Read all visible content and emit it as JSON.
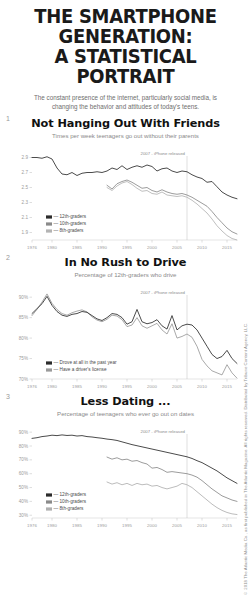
{
  "header": {
    "title_line1": "THE SMARTPHONE GENERATION:",
    "title_line2": "A STATISTICAL PORTRAIT",
    "subtitle": "The constant presence of the internet, particularly social media, is changing the behavior and attitudes of today's teens."
  },
  "copyright": "© 2018 The Atlantic Media Co., as first published in The Atlantic Magazine. All rights reserved. Distributed by Tribune Content Agency, LLC.",
  "sections": [
    {
      "number": "1"
    },
    {
      "number": "2"
    },
    {
      "number": "3"
    }
  ],
  "chart_data": [
    {
      "type": "line",
      "index": 0,
      "number": "1",
      "title": "Not Hanging Out With Friends",
      "subtitle": "Times per week teenagers go out without their parents",
      "xlabel": "",
      "ylabel": "",
      "xlim": [
        1976,
        2017
      ],
      "ylim": [
        1.8,
        3.0
      ],
      "yticks": [
        2.9,
        2.7,
        2.5,
        2.3,
        2.1,
        1.9
      ],
      "ytick_labels": [
        "2.9",
        "2.7",
        "2.5",
        "2.3",
        "2.1",
        "1.9"
      ],
      "xticks": [
        1976,
        1980,
        1985,
        1990,
        1995,
        2000,
        2005,
        2010,
        2015
      ],
      "xtick_labels": [
        "1976",
        "1980",
        "1985",
        "1990",
        "1995",
        "2000",
        "2005",
        "2010",
        "2015"
      ],
      "grid": false,
      "legend_position": "bottom-left",
      "annotation": {
        "text": "2007 - iPhone released",
        "x": 2007
      },
      "series": [
        {
          "name": "12th-graders",
          "color": "#2b2b2b",
          "x": [
            1976,
            1977,
            1978,
            1979,
            1980,
            1981,
            1982,
            1983,
            1984,
            1985,
            1986,
            1987,
            1988,
            1989,
            1990,
            1991,
            1992,
            1993,
            1994,
            1995,
            1996,
            1997,
            1998,
            1999,
            2000,
            2001,
            2002,
            2003,
            2004,
            2005,
            2006,
            2007,
            2008,
            2009,
            2010,
            2011,
            2012,
            2013,
            2014,
            2015,
            2016,
            2017
          ],
          "values": [
            2.9,
            2.9,
            2.89,
            2.91,
            2.88,
            2.76,
            2.68,
            2.67,
            2.7,
            2.66,
            2.69,
            2.7,
            2.7,
            2.71,
            2.7,
            2.72,
            2.76,
            2.74,
            2.79,
            2.74,
            2.77,
            2.79,
            2.77,
            2.8,
            2.78,
            2.72,
            2.75,
            2.76,
            2.72,
            2.7,
            2.72,
            2.71,
            2.67,
            2.64,
            2.62,
            2.57,
            2.58,
            2.51,
            2.44,
            2.4,
            2.37,
            2.35
          ]
        },
        {
          "name": "10th-graders",
          "color": "#8a8a8a",
          "x": [
            1991,
            1992,
            1993,
            1994,
            1995,
            1996,
            1997,
            1998,
            1999,
            2000,
            2001,
            2002,
            2003,
            2004,
            2005,
            2006,
            2007,
            2008,
            2009,
            2010,
            2011,
            2012,
            2013,
            2014,
            2015,
            2016,
            2017
          ],
          "values": [
            2.53,
            2.48,
            2.55,
            2.58,
            2.6,
            2.57,
            2.53,
            2.49,
            2.5,
            2.46,
            2.44,
            2.47,
            2.44,
            2.42,
            2.41,
            2.42,
            2.4,
            2.37,
            2.33,
            2.29,
            2.25,
            2.18,
            2.1,
            2.03,
            1.96,
            1.91,
            1.88
          ]
        },
        {
          "name": "8th-graders",
          "color": "#b4b4b4",
          "x": [
            1991,
            1992,
            1993,
            1994,
            1995,
            1996,
            1997,
            1998,
            1999,
            2000,
            2001,
            2002,
            2003,
            2004,
            2005,
            2006,
            2007,
            2008,
            2009,
            2010,
            2011,
            2012,
            2013,
            2014,
            2015,
            2016,
            2017
          ],
          "values": [
            2.5,
            2.46,
            2.52,
            2.56,
            2.58,
            2.54,
            2.49,
            2.45,
            2.46,
            2.42,
            2.41,
            2.44,
            2.4,
            2.39,
            2.38,
            2.39,
            2.37,
            2.33,
            2.28,
            2.22,
            2.16,
            2.08,
            1.99,
            1.92,
            1.86,
            1.82,
            1.8
          ]
        }
      ]
    },
    {
      "type": "line",
      "index": 1,
      "number": "2",
      "title": "In No Rush to Drive",
      "subtitle": "Percentage of 12th-graders who drive",
      "xlabel": "",
      "ylabel": "",
      "xlim": [
        1976,
        2017
      ],
      "ylim": [
        70,
        92
      ],
      "yticks": [
        90,
        85,
        80,
        75,
        70
      ],
      "ytick_labels": [
        "90%",
        "85%",
        "80%",
        "75%",
        "70%"
      ],
      "xticks": [
        1976,
        1980,
        1985,
        1990,
        1995,
        2000,
        2005,
        2010,
        2015
      ],
      "xtick_labels": [
        "1976",
        "1980",
        "1985",
        "1990",
        "1995",
        "2000",
        "2005",
        "2010",
        "2015"
      ],
      "grid": false,
      "legend_position": "bottom-left",
      "annotation": {
        "text": "2007 - iPhone released",
        "x": 2007
      },
      "series": [
        {
          "name": "Drove at all in the past year",
          "color": "#2b2b2b",
          "x": [
            1976,
            1977,
            1978,
            1979,
            1980,
            1981,
            1982,
            1983,
            1984,
            1985,
            1986,
            1987,
            1988,
            1989,
            1990,
            1991,
            1992,
            1993,
            1994,
            1995,
            1996,
            1997,
            1998,
            1999,
            2000,
            2001,
            2002,
            2003,
            2004,
            2005,
            2006,
            2007,
            2008,
            2009,
            2010,
            2011,
            2012,
            2013,
            2014,
            2015,
            2016,
            2017
          ],
          "values": [
            86.0,
            87.2,
            88.4,
            90.2,
            88.0,
            86.5,
            85.6,
            85.3,
            85.8,
            86.0,
            86.5,
            86.3,
            85.5,
            84.7,
            84.3,
            85.0,
            86.0,
            85.8,
            85.0,
            83.4,
            84.0,
            87.0,
            84.0,
            83.5,
            83.8,
            84.5,
            83.0,
            82.2,
            85.5,
            82.0,
            83.0,
            83.4,
            83.2,
            82.0,
            80.0,
            78.0,
            76.0,
            75.0,
            75.5,
            77.0,
            75.0,
            73.8
          ]
        },
        {
          "name": "Have a driver's license",
          "color": "#9a9a9a",
          "x": [
            1976,
            1977,
            1978,
            1979,
            1980,
            1981,
            1982,
            1983,
            1984,
            1985,
            1986,
            1987,
            1988,
            1989,
            1990,
            1991,
            1992,
            1993,
            1994,
            1995,
            1996,
            1997,
            1998,
            1999,
            2000,
            2001,
            2002,
            2003,
            2004,
            2005,
            2006,
            2007,
            2008,
            2009,
            2010,
            2011,
            2012,
            2013,
            2014,
            2015,
            2016,
            2017
          ],
          "values": [
            85.5,
            87.0,
            88.8,
            90.8,
            88.5,
            87.0,
            86.0,
            85.6,
            86.2,
            86.6,
            86.9,
            86.4,
            85.2,
            84.4,
            84.0,
            84.6,
            85.6,
            85.4,
            84.5,
            82.8,
            83.2,
            85.0,
            83.0,
            82.4,
            83.0,
            83.6,
            82.0,
            81.0,
            83.5,
            80.0,
            80.4,
            81.0,
            80.2,
            78.0,
            74.8,
            73.2,
            72.0,
            71.5,
            71.0,
            73.5,
            71.5,
            70.2
          ]
        }
      ]
    },
    {
      "type": "line",
      "index": 2,
      "number": "3",
      "title": "Less Dating ...",
      "subtitle": "Percentage of teenagers who ever go out on dates",
      "xlabel": "",
      "ylabel": "",
      "xlim": [
        1976,
        2017
      ],
      "ylim": [
        28,
        93
      ],
      "yticks": [
        90,
        80,
        70,
        60,
        50,
        40,
        30
      ],
      "ytick_labels": [
        "90%",
        "80%",
        "70%",
        "60%",
        "50%",
        "40%",
        "30%"
      ],
      "xticks": [
        1976,
        1980,
        1985,
        1990,
        1995,
        2000,
        2005,
        2010,
        2015
      ],
      "xtick_labels": [
        "1976",
        "1980",
        "1985",
        "1990",
        "1995",
        "2000",
        "2005",
        "2010",
        "2015"
      ],
      "grid": false,
      "legend_position": "bottom-left",
      "annotation": {
        "text": "2007 - iPhone released",
        "x": 2007
      },
      "series": [
        {
          "name": "12th-graders",
          "color": "#2b2b2b",
          "x": [
            1976,
            1977,
            1978,
            1979,
            1980,
            1981,
            1982,
            1983,
            1984,
            1985,
            1986,
            1987,
            1988,
            1989,
            1990,
            1991,
            1992,
            1993,
            1994,
            1995,
            1996,
            1997,
            1998,
            1999,
            2000,
            2001,
            2002,
            2003,
            2004,
            2005,
            2006,
            2007,
            2008,
            2009,
            2010,
            2011,
            2012,
            2013,
            2014,
            2015,
            2016,
            2017
          ],
          "values": [
            85.5,
            86.0,
            86.8,
            87.2,
            87.8,
            87.5,
            88.0,
            87.6,
            87.8,
            87.2,
            87.5,
            86.8,
            86.5,
            86.0,
            85.6,
            85.0,
            84.6,
            84.0,
            83.0,
            82.0,
            81.0,
            80.2,
            79.4,
            78.6,
            77.8,
            77.0,
            76.2,
            75.4,
            74.6,
            73.8,
            73.0,
            72.2,
            71.0,
            69.4,
            68.0,
            66.0,
            64.0,
            62.0,
            59.5,
            57.0,
            55.0,
            53.0
          ]
        },
        {
          "name": "10th-graders",
          "color": "#8a8a8a",
          "x": [
            1991,
            1992,
            1993,
            1994,
            1995,
            1996,
            1997,
            1998,
            1999,
            2000,
            2001,
            2002,
            2003,
            2004,
            2005,
            2006,
            2007,
            2008,
            2009,
            2010,
            2011,
            2012,
            2013,
            2014,
            2015,
            2016,
            2017
          ],
          "values": [
            72.0,
            70.5,
            71.5,
            70.0,
            70.5,
            69.0,
            69.5,
            68.0,
            67.0,
            64.0,
            64.5,
            63.0,
            61.0,
            61.5,
            61.0,
            60.5,
            60.0,
            59.0,
            57.5,
            55.0,
            52.0,
            49.0,
            46.5,
            44.0,
            42.5,
            41.0,
            40.0
          ]
        },
        {
          "name": "8th-graders",
          "color": "#b0b0b0",
          "x": [
            1991,
            1992,
            1993,
            1994,
            1995,
            1996,
            1997,
            1998,
            1999,
            2000,
            2001,
            2002,
            2003,
            2004,
            2005,
            2006,
            2007,
            2008,
            2009,
            2010,
            2011,
            2012,
            2013,
            2014,
            2015,
            2016,
            2017
          ],
          "values": [
            54.0,
            52.5,
            53.5,
            52.0,
            53.0,
            51.5,
            53.0,
            52.0,
            52.5,
            51.0,
            51.5,
            50.0,
            49.0,
            50.0,
            51.0,
            53.0,
            52.0,
            50.0,
            47.0,
            44.0,
            41.0,
            38.0,
            35.5,
            33.5,
            32.0,
            31.0,
            30.5
          ]
        }
      ]
    }
  ]
}
